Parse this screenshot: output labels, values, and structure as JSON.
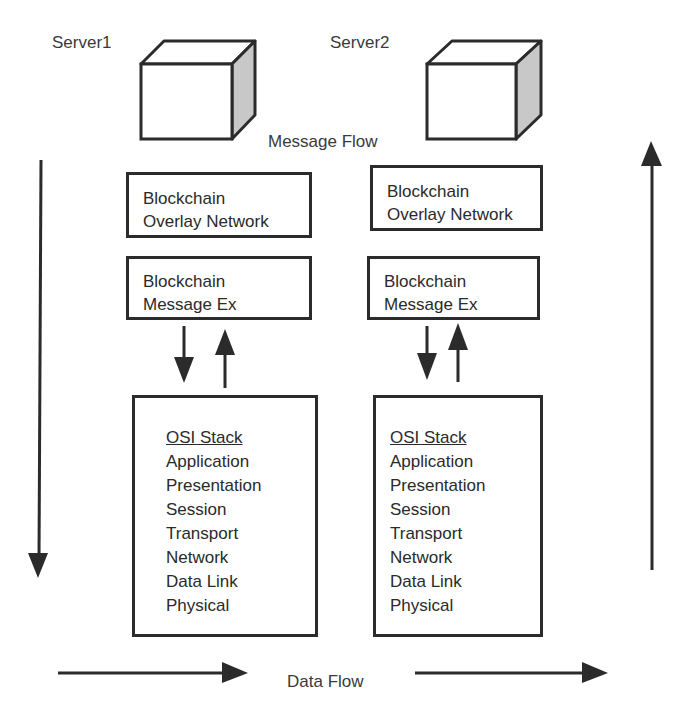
{
  "diagram": {
    "servers": [
      {
        "label": "Server1"
      },
      {
        "label": "Server2"
      }
    ],
    "message_flow_label": "Message Flow",
    "data_flow_label": "Data Flow",
    "stacks": [
      {
        "overlay_box": {
          "line1": "Blockchain",
          "line2": "Overlay Network"
        },
        "message_box": {
          "line1": "Blockchain",
          "line2": "Message Ex"
        },
        "osi": {
          "title": "OSI Stack",
          "layers": [
            "Application",
            "Presentation",
            "Session",
            "Transport",
            "Network",
            "Data Link",
            "Physical"
          ]
        }
      },
      {
        "overlay_box": {
          "line1": "Blockchain",
          "line2": "Overlay Network"
        },
        "message_box": {
          "line1": "Blockchain",
          "line2": "Message Ex"
        },
        "osi": {
          "title": "OSI Stack",
          "layers": [
            "Application",
            "Presentation",
            "Session",
            "Transport",
            "Network",
            "Data Link",
            "Physical"
          ]
        }
      }
    ],
    "arrows": {
      "left_vertical": "down",
      "right_vertical": "up",
      "bottom_left": "right",
      "bottom_right": "right",
      "stack_interlinks": [
        "down",
        "up"
      ]
    },
    "colors": {
      "stroke": "#2b2b2b",
      "cube_side": "#c8c8c8",
      "background": "#ffffff"
    }
  }
}
